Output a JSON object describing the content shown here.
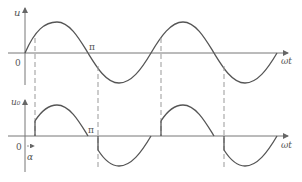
{
  "figure": {
    "top_plot": {
      "y_label": "u",
      "x_label": "ωt",
      "origin_label": "0",
      "pi_label": "π",
      "waveform": "full sine, 2 periods"
    },
    "bottom_plot": {
      "y_label": "u₀",
      "x_label": "ωt",
      "origin_label": "0",
      "pi_label": "π",
      "alpha_label": "α",
      "waveform": "chopped sine conducting from α to π each half-cycle"
    },
    "colors": {
      "curve": "#555555",
      "axis": "#777777",
      "dashed": "#999999"
    }
  }
}
